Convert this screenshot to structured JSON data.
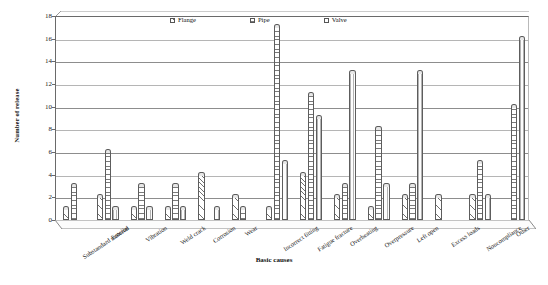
{
  "chart_data": {
    "type": "bar",
    "title": "",
    "xlabel": "Basic causes",
    "ylabel": "Number of release",
    "ylim": [
      0,
      18
    ],
    "ytick_step": 2,
    "yticks": [
      0,
      2,
      4,
      6,
      8,
      10,
      12,
      14,
      16,
      18
    ],
    "grid": true,
    "legend_position": "top-inside",
    "categories": [
      "Substandard material",
      "Erosion",
      "Vibration",
      "Weld crack",
      "Corrosion",
      "Wear",
      "Incorrect fitting",
      "Fatigue fracture",
      "Overheating",
      "Overpressure",
      "Left open",
      "Excess loads",
      "Noncompliance",
      "Other"
    ],
    "series": [
      {
        "name": "Flange",
        "values": [
          1,
          2,
          1,
          1,
          4,
          2,
          1,
          4,
          2,
          1,
          2,
          2,
          2,
          0
        ]
      },
      {
        "name": "Pipe",
        "values": [
          3,
          6,
          3,
          3,
          0,
          1,
          17,
          11,
          3,
          8,
          3,
          0,
          5,
          10
        ]
      },
      {
        "name": "Valve",
        "values": [
          0,
          1,
          1,
          1,
          1,
          0,
          5,
          9,
          13,
          3,
          13,
          0,
          2,
          16
        ]
      }
    ]
  },
  "legend": {
    "items": [
      {
        "label": "Flange",
        "swatch": "hatch-diagonal"
      },
      {
        "label": "Pipe",
        "swatch": "hatch-horizontal"
      },
      {
        "label": "Valve",
        "swatch": "hatch-vertical"
      }
    ]
  },
  "axes": {
    "y_title": "Number of release",
    "x_title": "Basic causes"
  }
}
